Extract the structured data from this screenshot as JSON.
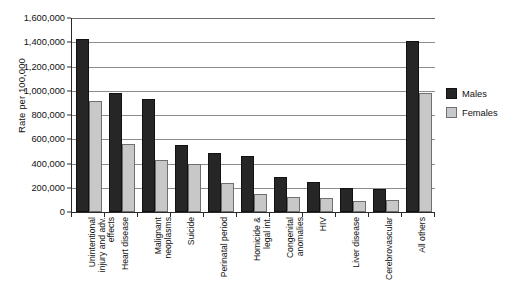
{
  "chart_data": {
    "type": "bar",
    "title": "",
    "subtitle": "",
    "xlabel": "",
    "ylabel": "Rate per 100,000",
    "ylim": [
      0,
      1600000
    ],
    "ytick_step": 200000,
    "ytick_labels": [
      "1,600,000",
      "1,400,000",
      "1,200,000",
      "1,000,000",
      "800,000",
      "600,000",
      "400,000",
      "200,000",
      "0"
    ],
    "ytick_values": [
      1600000,
      1400000,
      1200000,
      1000000,
      800000,
      600000,
      400000,
      200000,
      0
    ],
    "grid": true,
    "grid_axis": "y",
    "legend_position": "right",
    "orientation": "vertical",
    "categories": [
      "Unintentional injury and adv. effects",
      "Heart disease",
      "Malignant neoplasms",
      "Suicide",
      "Perinatal period",
      "Homicide & legal int.",
      "Congenital anomalies",
      "HIV",
      "Liver disease",
      "Cerebrovascular",
      "All others"
    ],
    "category_lines": [
      [
        "Unintentional",
        "injury and adv.",
        "effects"
      ],
      [
        "Heart disease"
      ],
      [
        "Malignant",
        "neoplasms"
      ],
      [
        "Suicide"
      ],
      [
        "Perinatal period"
      ],
      [
        "Homicide &",
        "legal int."
      ],
      [
        "Congenital",
        "anomalies"
      ],
      [
        "HIV"
      ],
      [
        "Liver disease"
      ],
      [
        "Cerebrovascular"
      ],
      [
        "All others"
      ]
    ],
    "series": [
      {
        "name": "Males",
        "color": "#262626",
        "values": [
          1430000,
          985000,
          930000,
          555000,
          490000,
          465000,
          290000,
          250000,
          195000,
          190000,
          1410000
        ]
      },
      {
        "name": "Females",
        "color": "#c8c8c8",
        "values": [
          915000,
          565000,
          425000,
          400000,
          240000,
          145000,
          125000,
          115000,
          90000,
          95000,
          985000
        ]
      }
    ]
  },
  "legend": {
    "items": [
      {
        "label": "Males",
        "swatch": "males"
      },
      {
        "label": "Females",
        "swatch": "females"
      }
    ]
  },
  "colors": {
    "males": "#262626",
    "females": "#c8c8c8",
    "axis": "#2a2a2a",
    "gridline": "#8c8c8c",
    "background": "#ffffff"
  }
}
